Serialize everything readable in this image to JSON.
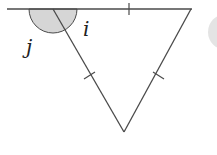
{
  "diagram": {
    "type": "geometry",
    "labels": {
      "angle_j": "j",
      "angle_i": "i"
    },
    "tick_marks": {
      "top_side": 1,
      "left_side": 1,
      "right_side": 1
    },
    "colors": {
      "line": "#4a4a4a",
      "angle_fill": "#d4d4d4",
      "background": "#ffffff"
    }
  }
}
